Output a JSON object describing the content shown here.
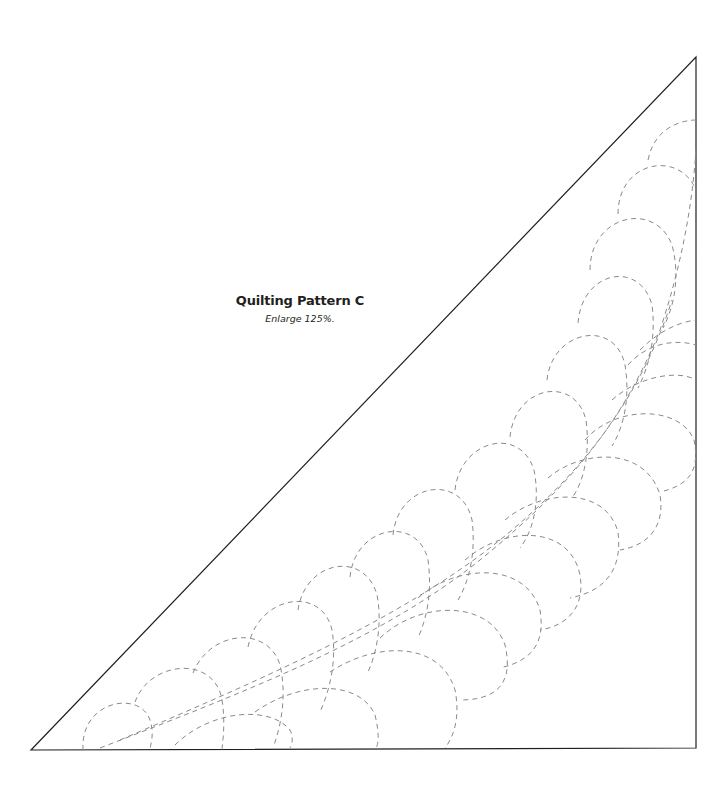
{
  "figure": {
    "title": "Quilting Pattern C",
    "subtitle": "Enlarge 125%."
  },
  "pattern": {
    "shape": "right-triangle",
    "motif": "feather",
    "line_style": "dashed",
    "colors": {
      "outline": "#231f20",
      "stitch_line": "#8a8a8a"
    }
  }
}
